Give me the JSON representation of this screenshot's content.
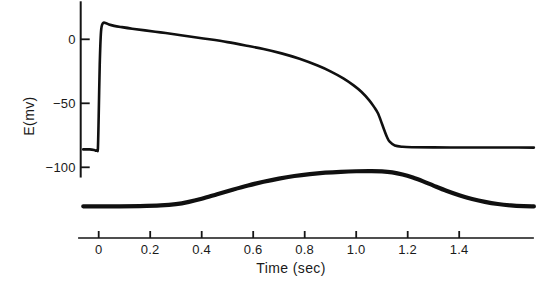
{
  "figure": {
    "background_color": "#ffffff",
    "trace_color": "#101010",
    "axis_color": "#151515"
  },
  "chart_data": {
    "type": "line",
    "title": "",
    "xlabel": "Time (sec)",
    "ylabel": "E(mv)",
    "xlim": [
      -0.08,
      1.69
    ],
    "ylim": [
      -135,
      25
    ],
    "grid": false,
    "legend": "none",
    "x_ticks": [
      0,
      0.2,
      0.4,
      0.6,
      0.8,
      1.0,
      1.2,
      1.4
    ],
    "x_tick_labels": [
      "0",
      "0.2",
      "0.4",
      "0.6",
      "0.8",
      "1.0",
      "1.2",
      "1.4"
    ],
    "y_ticks": [
      0,
      -50,
      -100
    ],
    "y_tick_labels": [
      "0",
      "-50",
      "-100"
    ],
    "series": [
      {
        "name": "action-potential",
        "description": "membrane potential E(mv) vs time",
        "x": [
          -0.06,
          -0.035,
          -0.018,
          -0.012,
          -0.009,
          -0.006,
          -0.003,
          0.0,
          0.004,
          0.009,
          0.016,
          0.026,
          0.04,
          0.06,
          0.09,
          0.13,
          0.18,
          0.24,
          0.3,
          0.36,
          0.43,
          0.5,
          0.57,
          0.64,
          0.71,
          0.78,
          0.85,
          0.9,
          0.95,
          0.99,
          1.02,
          1.05,
          1.07,
          1.085,
          1.1,
          1.11,
          1.12,
          1.13,
          1.15,
          1.18,
          1.22,
          1.3,
          1.4,
          1.5,
          1.6,
          1.69
        ],
        "y": [
          -86,
          -86,
          -86.5,
          -87,
          -87,
          -86.5,
          -85,
          -60,
          -20,
          6,
          12.5,
          12.8,
          11.5,
          10.5,
          9.5,
          8.3,
          7.0,
          5.4,
          3.8,
          2.0,
          0.0,
          -2.2,
          -4.8,
          -7.6,
          -11.0,
          -15.2,
          -20.5,
          -25.0,
          -30.5,
          -36.0,
          -41.0,
          -47.5,
          -53.0,
          -58.0,
          -66.0,
          -71.5,
          -76.5,
          -80.0,
          -83.0,
          -84.0,
          -84.3,
          -84.4,
          -84.5,
          -84.5,
          -84.5,
          -84.6
        ],
        "linewidth": 2.6
      },
      {
        "name": "tension",
        "description": "contraction/tension trace (lower, arbitrary units)",
        "x": [
          -0.06,
          0.0,
          0.08,
          0.16,
          0.24,
          0.3,
          0.35,
          0.4,
          0.46,
          0.52,
          0.58,
          0.64,
          0.7,
          0.76,
          0.82,
          0.88,
          0.94,
          1.0,
          1.06,
          1.1,
          1.14,
          1.18,
          1.22,
          1.26,
          1.3,
          1.35,
          1.4,
          1.45,
          1.5,
          1.55,
          1.6,
          1.65,
          1.69
        ],
        "y": [
          -130.5,
          -130.5,
          -130.5,
          -130.3,
          -129.8,
          -128.8,
          -127.0,
          -124.5,
          -121.0,
          -117.5,
          -114.2,
          -111.3,
          -108.8,
          -106.8,
          -105.3,
          -104.2,
          -103.5,
          -103.1,
          -103.0,
          -103.2,
          -104.0,
          -105.6,
          -108.0,
          -111.0,
          -114.3,
          -118.3,
          -121.8,
          -124.7,
          -127.0,
          -128.7,
          -129.8,
          -130.4,
          -130.6
        ],
        "linewidth": 4.2
      }
    ]
  }
}
